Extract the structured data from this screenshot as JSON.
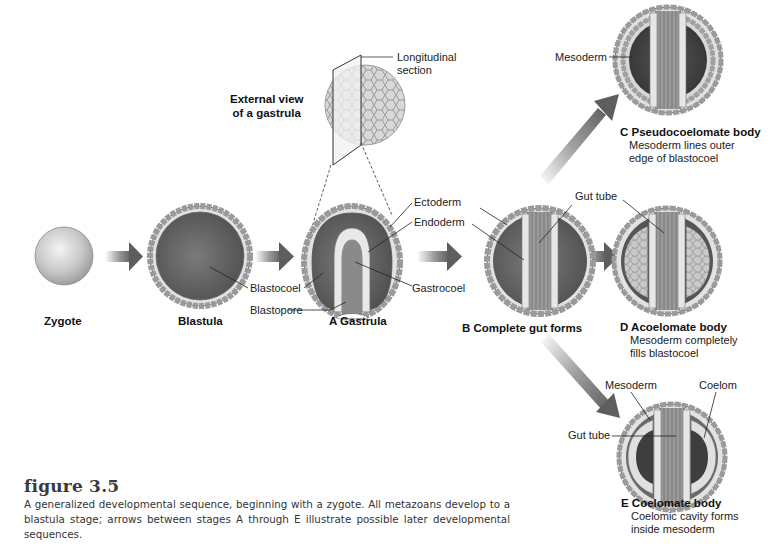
{
  "figure": {
    "title": "figure 3.5",
    "caption": "A generalized developmental sequence, beginning with a zygote. All metazoans develop to a blastula stage; arrows between stages A through E illustrate possible later developmental sequences."
  },
  "inset": {
    "label_line1": "External view",
    "label_line2": "of a gastrula",
    "section_line1": "Longitudinal",
    "section_line2": "section"
  },
  "stages": {
    "zygote": {
      "title": "Zygote"
    },
    "blastula": {
      "title": "Blastula"
    },
    "gastrula": {
      "title": "A Gastrula"
    },
    "complete_gut": {
      "title": "B Complete gut forms"
    },
    "pseudocoelomate": {
      "title": "C Pseudocoelomate body",
      "desc_line1": "Mesoderm lines outer",
      "desc_line2": "edge of blastocoel"
    },
    "acoelomate": {
      "title": "D Acoelomate body",
      "desc_line1": "Mesoderm completely",
      "desc_line2": "fills blastocoel"
    },
    "coelomate": {
      "title": "E Coelomate body",
      "desc_line1": "Coelomic cavity forms",
      "desc_line2": "inside mesoderm"
    }
  },
  "labels": {
    "blastocoel": "Blastocoel",
    "blastopore": "Blastopore",
    "ectoderm": "Ectoderm",
    "endoderm": "Endoderm",
    "gastrocoel": "Gastrocoel",
    "gut_tube_b": "Gut tube",
    "mesoderm_c": "Mesoderm",
    "mesoderm_e": "Mesoderm",
    "coelom": "Coelom",
    "gut_tube_e": "Gut tube"
  },
  "colors": {
    "background": "#ffffff",
    "cavity_dark": "#5e5e5e",
    "cell_light": "#e4e4e4",
    "cell_border": "#8a8a8a",
    "arrow": "#6a6a6a",
    "text": "#1a1a1a"
  }
}
